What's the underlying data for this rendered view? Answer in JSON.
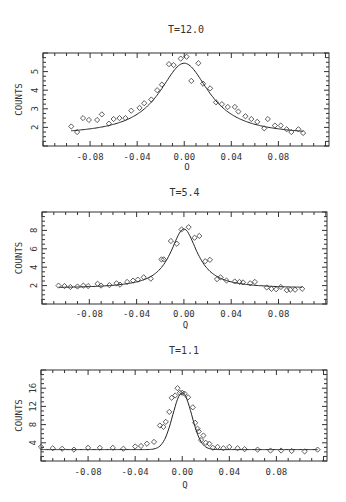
{
  "figure": {
    "panels": [
      {
        "title": "T=12.0",
        "xlabel": "Q",
        "ylabel": "COUNTS"
      },
      {
        "title": "T=5.4",
        "xlabel": "Q",
        "ylabel": "COUNTS"
      },
      {
        "title": "T=1.1",
        "xlabel": "Q",
        "ylabel": "COUNTS"
      }
    ]
  },
  "chart_data": [
    {
      "type": "scatter",
      "title": "T=12.0",
      "xlabel": "Q",
      "ylabel": "COUNTS",
      "xlim": [
        -0.12,
        0.123
      ],
      "ylim": [
        1.0,
        6.0
      ],
      "xticks": [
        -0.08,
        -0.04,
        0.0,
        0.04,
        0.08
      ],
      "xtick_labels": [
        "-0.08",
        "-0.04",
        "0.00",
        "0.04",
        "0.08"
      ],
      "yticks": [
        2,
        3,
        4,
        5
      ],
      "ytick_labels": [
        "2",
        "3",
        "4",
        "5"
      ],
      "grid": false,
      "legend": null,
      "series": [
        {
          "name": "data",
          "marker": "diamond",
          "x": [
            -0.096,
            -0.091,
            -0.086,
            -0.081,
            -0.074,
            -0.07,
            -0.064,
            -0.06,
            -0.055,
            -0.05,
            -0.045,
            -0.038,
            -0.034,
            -0.028,
            -0.023,
            -0.019,
            -0.013,
            -0.009,
            -0.003,
            0.002,
            0.006,
            0.012,
            0.016,
            0.022,
            0.027,
            0.032,
            0.037,
            0.043,
            0.046,
            0.052,
            0.057,
            0.062,
            0.068,
            0.071,
            0.077,
            0.082,
            0.087,
            0.091,
            0.097,
            0.101
          ],
          "y": [
            2.05,
            1.75,
            2.5,
            2.4,
            2.4,
            2.7,
            2.2,
            2.45,
            2.5,
            2.5,
            2.9,
            3.05,
            3.3,
            3.5,
            4.0,
            4.3,
            5.4,
            5.35,
            5.7,
            5.8,
            4.5,
            5.45,
            4.35,
            4.1,
            3.35,
            3.25,
            3.1,
            3.1,
            2.85,
            2.6,
            2.45,
            2.3,
            1.95,
            2.45,
            2.1,
            2.1,
            1.9,
            1.75,
            1.9,
            1.7
          ]
        },
        {
          "name": "fit",
          "type": "line",
          "model": "lorentzian",
          "peak": 5.45,
          "center": 0.0,
          "hwhm": 0.026,
          "background": 1.55,
          "x_range": [
            -0.096,
            0.101
          ]
        }
      ]
    },
    {
      "type": "scatter",
      "title": "T=5.4",
      "xlabel": "Q",
      "ylabel": "COUNTS",
      "xlim": [
        -0.12,
        0.121
      ],
      "ylim": [
        0.0,
        10.0
      ],
      "xticks": [
        -0.08,
        -0.04,
        0.0,
        0.04,
        0.08
      ],
      "xtick_labels": [
        "-0.08",
        "-0.04",
        "0.00",
        "0.04",
        "0.08"
      ],
      "yticks": [
        2,
        4,
        6,
        8
      ],
      "ytick_labels": [
        "2",
        "4",
        "6",
        "8"
      ],
      "grid": false,
      "legend": null,
      "series": [
        {
          "name": "data",
          "marker": "diamond",
          "x": [
            -0.106,
            -0.101,
            -0.096,
            -0.09,
            -0.085,
            -0.081,
            -0.073,
            -0.07,
            -0.063,
            -0.057,
            -0.054,
            -0.048,
            -0.043,
            -0.039,
            -0.034,
            -0.028,
            -0.019,
            -0.017,
            -0.011,
            -0.006,
            -0.002,
            0.004,
            0.009,
            0.013,
            0.018,
            0.022,
            0.028,
            0.031,
            0.036,
            0.043,
            0.047,
            0.05,
            0.056,
            0.06,
            0.07,
            0.074,
            0.078,
            0.082,
            0.087,
            0.09,
            0.094,
            0.1
          ],
          "y": [
            2.0,
            1.95,
            1.85,
            1.9,
            2.0,
            1.95,
            2.2,
            2.0,
            2.05,
            2.25,
            2.1,
            2.4,
            2.55,
            2.65,
            2.9,
            2.75,
            4.85,
            4.85,
            6.85,
            6.55,
            8.1,
            8.35,
            7.2,
            7.4,
            4.65,
            4.8,
            2.7,
            2.9,
            2.55,
            2.45,
            2.4,
            2.35,
            2.25,
            2.4,
            1.8,
            1.65,
            1.6,
            1.85,
            1.5,
            1.55,
            1.55,
            1.65
          ]
        },
        {
          "name": "fit",
          "type": "line",
          "model": "lorentzian",
          "peak": 8.15,
          "center": 0.0,
          "hwhm": 0.014,
          "background": 1.7,
          "x_range": [
            -0.106,
            0.1
          ]
        }
      ]
    },
    {
      "type": "scatter",
      "title": "T=1.1",
      "xlabel": "Q",
      "ylabel": "COUNTS",
      "xlim": [
        -0.12,
        0.123
      ],
      "ylim": [
        0.0,
        20.0
      ],
      "xticks": [
        -0.08,
        -0.04,
        0.0,
        0.04,
        0.08
      ],
      "xtick_labels": [
        "-0.08",
        "-0.04",
        "0.00",
        "0.04",
        "0.08"
      ],
      "yticks": [
        4,
        8,
        12,
        16
      ],
      "ytick_labels": [
        "4",
        "8",
        "12",
        "16"
      ],
      "grid": false,
      "legend": null,
      "series": [
        {
          "name": "data",
          "marker": "diamond",
          "x": [
            -0.12,
            -0.11,
            -0.102,
            -0.092,
            -0.08,
            -0.07,
            -0.059,
            -0.05,
            -0.04,
            -0.035,
            -0.03,
            -0.024,
            -0.019,
            -0.016,
            -0.014,
            -0.011,
            -0.009,
            -0.006,
            -0.004,
            -0.002,
            0.0,
            0.002,
            0.005,
            0.009,
            0.011,
            0.013,
            0.014,
            0.016,
            0.018,
            0.02,
            0.023,
            0.026,
            0.03,
            0.035,
            0.04,
            0.047,
            0.053,
            0.064,
            0.075,
            0.084,
            0.093,
            0.104,
            0.115
          ],
          "y": [
            3.1,
            2.8,
            2.7,
            2.5,
            2.9,
            2.9,
            2.9,
            2.7,
            3.2,
            3.3,
            3.8,
            4.2,
            7.8,
            7.5,
            8.6,
            10.8,
            13.9,
            14.4,
            16.0,
            15.0,
            15.0,
            14.8,
            14.0,
            11.8,
            8.4,
            7.1,
            6.5,
            4.6,
            5.6,
            4.0,
            3.8,
            2.9,
            3.1,
            2.8,
            3.1,
            2.8,
            2.6,
            2.5,
            2.3,
            2.3,
            2.2,
            2.1,
            2.5
          ]
        },
        {
          "name": "fit",
          "type": "line",
          "model": "gaussian-like",
          "peak": 15.0,
          "center": 0.0,
          "hwhm": 0.0095,
          "background": 2.5,
          "x_range": [
            -0.12,
            0.115
          ]
        }
      ]
    }
  ]
}
